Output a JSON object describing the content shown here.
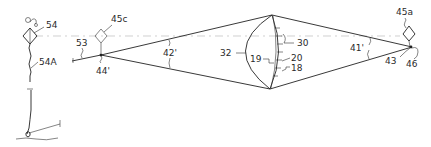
{
  "figure": {
    "type": "patent-line-drawing",
    "labels": {
      "post_top": "54",
      "post_line": "54A",
      "left_marker": "45c",
      "left_lead": "53",
      "left_vertex": "44'",
      "left_angle": "42'",
      "arc_outer": "32",
      "lens_inner": "19",
      "lens_mid": "20",
      "lens_edge": "18",
      "lens_top": "30",
      "right_angle": "41'",
      "right_marker": "45a",
      "right_lower": "43",
      "right_vertex": "46"
    },
    "colors": {
      "ink": "#222222",
      "centerline": "#bbbbbb",
      "background": "#ffffff"
    }
  }
}
